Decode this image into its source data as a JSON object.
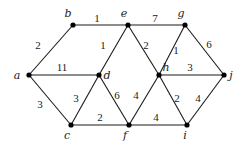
{
  "diagram": {
    "type": "weighted-undirected-graph",
    "nodes": [
      {
        "id": "a",
        "x": 29,
        "y": 75,
        "lx": 17,
        "ly": 79
      },
      {
        "id": "b",
        "x": 73,
        "y": 25,
        "lx": 68,
        "ly": 17
      },
      {
        "id": "c",
        "x": 71,
        "y": 125,
        "lx": 67,
        "ly": 139
      },
      {
        "id": "d",
        "x": 99,
        "y": 75,
        "lx": 107,
        "ly": 79
      },
      {
        "id": "e",
        "x": 128,
        "y": 25,
        "lx": 124,
        "ly": 17
      },
      {
        "id": "f",
        "x": 129,
        "y": 125,
        "lx": 125,
        "ly": 139
      },
      {
        "id": "g",
        "x": 185,
        "y": 25,
        "lx": 181,
        "ly": 17
      },
      {
        "id": "h",
        "x": 159,
        "y": 75,
        "lx": 166,
        "ly": 71
      },
      {
        "id": "i",
        "x": 187,
        "y": 125,
        "lx": 185,
        "ly": 139
      },
      {
        "id": "j",
        "x": 224,
        "y": 75,
        "lx": 231,
        "ly": 79
      }
    ],
    "edges": [
      {
        "from": "a",
        "to": "b",
        "weight": "2",
        "lx": 38,
        "ly": 49
      },
      {
        "from": "b",
        "to": "e",
        "weight": "1",
        "lx": 97,
        "ly": 22
      },
      {
        "from": "e",
        "to": "d",
        "weight": "1",
        "lx": 103,
        "ly": 49
      },
      {
        "from": "e",
        "to": "g",
        "weight": "7",
        "lx": 155,
        "ly": 22
      },
      {
        "from": "e",
        "to": "h",
        "weight": "2",
        "lx": 146,
        "ly": 49
      },
      {
        "from": "g",
        "to": "h",
        "weight": "1",
        "lx": 176,
        "ly": 54
      },
      {
        "from": "g",
        "to": "j",
        "weight": "6",
        "lx": 209,
        "ly": 48
      },
      {
        "from": "a",
        "to": "d",
        "weight": "11",
        "lx": 62,
        "ly": 71
      },
      {
        "from": "h",
        "to": "j",
        "weight": "3",
        "lx": 190,
        "ly": 71
      },
      {
        "from": "a",
        "to": "c",
        "weight": "3",
        "lx": 40,
        "ly": 108
      },
      {
        "from": "c",
        "to": "d",
        "weight": "3",
        "lx": 76,
        "ly": 102
      },
      {
        "from": "d",
        "to": "f",
        "weight": "6",
        "lx": 117,
        "ly": 99
      },
      {
        "from": "f",
        "to": "h",
        "weight": "4",
        "lx": 136,
        "ly": 99
      },
      {
        "from": "h",
        "to": "i",
        "weight": "2",
        "lx": 177,
        "ly": 102
      },
      {
        "from": "i",
        "to": "j",
        "weight": "4",
        "lx": 198,
        "ly": 102
      },
      {
        "from": "c",
        "to": "f",
        "weight": "2",
        "lx": 100,
        "ly": 121
      },
      {
        "from": "f",
        "to": "i",
        "weight": "4",
        "lx": 156,
        "ly": 121
      }
    ]
  }
}
